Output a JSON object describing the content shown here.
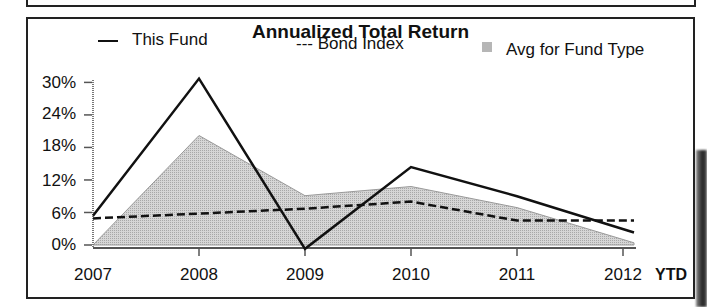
{
  "chart_data": {
    "type": "line",
    "title": "Annualized Total Return",
    "xlabel": "",
    "ylabel": "",
    "categories": [
      "2007",
      "2008",
      "2009",
      "2010",
      "2011",
      "2012"
    ],
    "x_suffix_label": "YTD",
    "y_ticks": [
      "30%",
      "24%",
      "18%",
      "12%",
      "6%",
      "0%"
    ],
    "ylim": [
      0,
      30
    ],
    "grid": false,
    "legend_position": "top",
    "series": [
      {
        "name": "This Fund",
        "style": "solid line",
        "values": [
          5.4,
          30.7,
          -0.7,
          14.4,
          9.0,
          2.3
        ]
      },
      {
        "name": "Bond Index",
        "style": "dashed line",
        "values": [
          4.9,
          5.8,
          6.7,
          8.0,
          4.5,
          4.5
        ]
      },
      {
        "name": "Avg for Fund Type",
        "style": "shaded area",
        "values": [
          0.0,
          20.2,
          9.1,
          10.8,
          6.9,
          0.4
        ]
      }
    ]
  },
  "legend": {
    "fund": "This Fund",
    "bond": "--- Bond Index",
    "avg": "Avg for Fund Type"
  },
  "colors": {
    "line": "#111111",
    "area_fill": "#cfcfcf",
    "area_edge": "#9a9a9a"
  }
}
